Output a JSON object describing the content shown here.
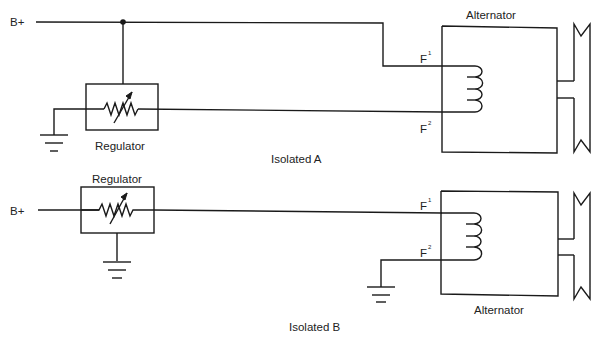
{
  "diagram": {
    "type": "electrical-schematic",
    "circuits": [
      {
        "id": "isolated-a",
        "caption": "Isolated A",
        "supply_label": "B+",
        "regulator_label": "Regulator",
        "alternator_label": "Alternator",
        "field_terminals": {
          "f1": "F",
          "f1_sup": "1",
          "f2": "F",
          "f2_sup": "2"
        }
      },
      {
        "id": "isolated-b",
        "caption": "Isolated B",
        "supply_label": "B+",
        "regulator_label": "Regulator",
        "alternator_label": "Alternator",
        "field_terminals": {
          "f1": "F",
          "f1_sup": "1",
          "f2": "F",
          "f2_sup": "2"
        }
      }
    ],
    "icons": [
      "ground-icon",
      "variable-resistor-icon",
      "field-coil-icon",
      "pulley-icon",
      "junction-dot-icon"
    ]
  }
}
